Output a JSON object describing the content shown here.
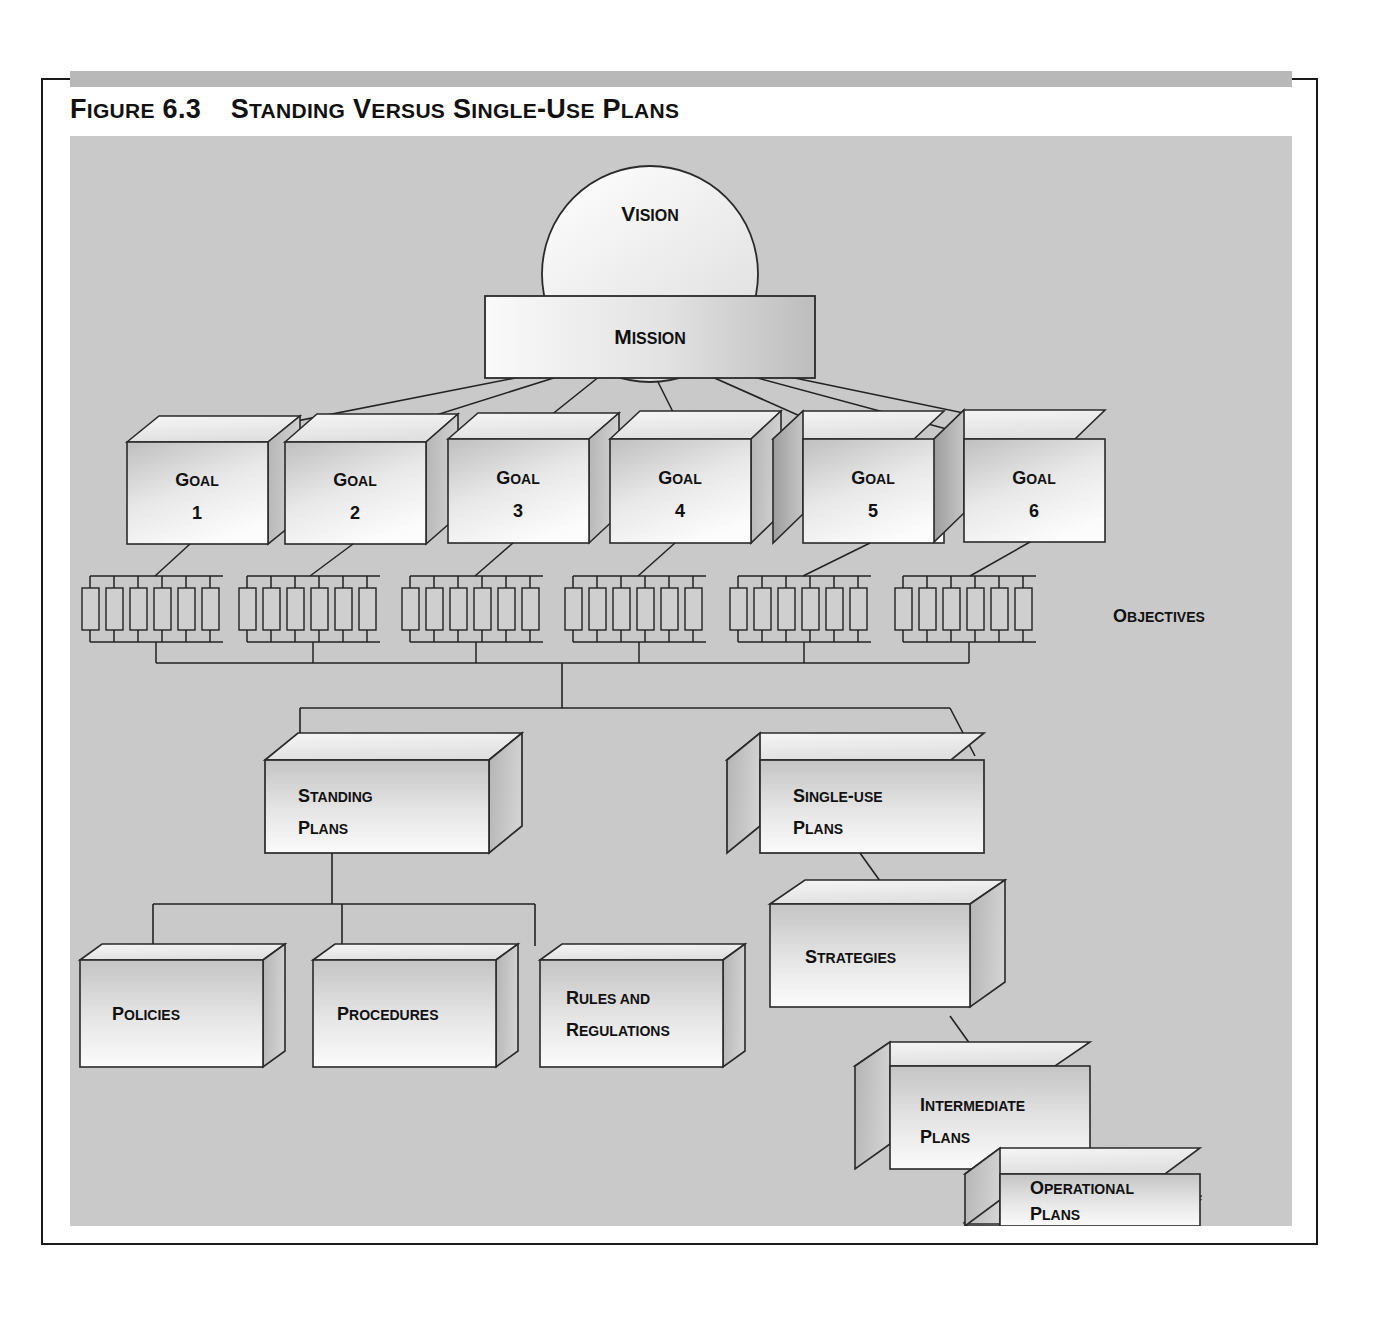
{
  "figure": {
    "number": "Figure 6.3",
    "title": "Standing Versus Single-Use Plans",
    "title_full": "Figure 6.3  Standing Versus Single-Use Plans"
  },
  "colors": {
    "panel_background": "#c9c9c9",
    "frame_border": "#1a1a1a",
    "stripe": "#b8b8b8",
    "box_face_light": "#f2f2f2",
    "box_face_dark": "#c0c0c0",
    "box_top": "#ededed",
    "box_side_dark": "#a8a8a8",
    "box_side_darker": "#8f8f8f",
    "line": "#222222",
    "text": "#111111"
  },
  "diagram": {
    "type": "hierarchy-flowchart",
    "apex": {
      "vision": {
        "label": "Vision",
        "shape": "circle"
      },
      "mission": {
        "label": "Mission",
        "shape": "rectangle"
      }
    },
    "goals_row": {
      "objectives_label": "Objectives",
      "objectives_per_goal": 6,
      "goals": [
        {
          "label": "Goal",
          "number": "1",
          "side": "right"
        },
        {
          "label": "Goal",
          "number": "2",
          "side": "right"
        },
        {
          "label": "Goal",
          "number": "3",
          "side": "right"
        },
        {
          "label": "Goal",
          "number": "4",
          "side": "right"
        },
        {
          "label": "Goal",
          "number": "5",
          "side": "left"
        },
        {
          "label": "Goal",
          "number": "6",
          "side": "left"
        }
      ]
    },
    "branches": [
      {
        "name": "standing",
        "title_line1": "Standing",
        "title_line2": "Plans",
        "children": [
          {
            "line1": "Policies",
            "line2": ""
          },
          {
            "line1": "Procedures",
            "line2": ""
          },
          {
            "line1": "Rules and",
            "line2": "Regulations"
          }
        ]
      },
      {
        "name": "single-use",
        "title_line1": "Single-use",
        "title_line2": "Plans",
        "children": [
          {
            "line1": "Strategies",
            "line2": ""
          },
          {
            "line1": "Intermediate",
            "line2": "Plans"
          },
          {
            "line1": "Operational",
            "line2": "Plans"
          }
        ]
      }
    ]
  }
}
